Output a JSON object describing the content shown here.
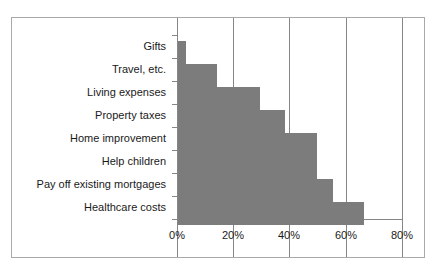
{
  "chart_data": {
    "type": "bar",
    "orientation": "horizontal",
    "title": "",
    "xlabel": "",
    "ylabel": "",
    "xlim": [
      0,
      80
    ],
    "xtick_labels": [
      "0%",
      "20%",
      "40%",
      "60%",
      "80%"
    ],
    "xtick_values": [
      0,
      20,
      40,
      60,
      80
    ],
    "grid": "vertical",
    "legend": "none",
    "bar_color": "#7c7c7c",
    "axis_color": "#868686",
    "border_color": "#a9a9a9",
    "background_color": "#ffffff",
    "categories": [
      "Gifts",
      "Travel, etc.",
      "Living expenses",
      "Property taxes",
      "Home improvement",
      "Help children",
      "Pay off existing mortgages",
      "Healthcare costs"
    ],
    "values": [
      3,
      14,
      29,
      38,
      49.5,
      49.5,
      55,
      66
    ]
  }
}
